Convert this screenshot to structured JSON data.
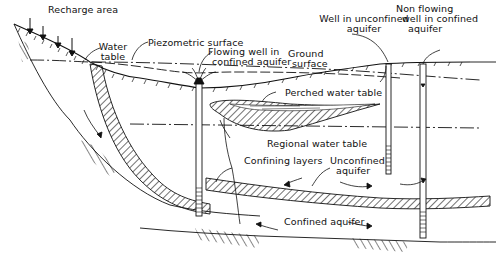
{
  "diagram": {
    "labels": {
      "recharge_area": "Recharge area",
      "water_table_1": "Water",
      "water_table_2": "table",
      "piezometric_surface": "Piezometric surface",
      "flowing_well_1": "Flowing well in",
      "flowing_well_2": "confined aquifer",
      "ground_surface_1": "Ground",
      "ground_surface_2": "surface",
      "well_unconfined_1": "Well in unconfined",
      "well_unconfined_2": "aquifer",
      "nonflowing_1": "Non flowing",
      "nonflowing_2": "well in confined",
      "nonflowing_3": "aquifer",
      "perched_water_table": "Perched water table",
      "regional_water_table": "Regional water table",
      "confining_layers": "Confining layers",
      "unconfined_aquifer_1": "Unconfined",
      "unconfined_aquifer_2": "aquifer",
      "confined_aquifer": "Confined aquifer"
    },
    "colors": {
      "ink": "#111111",
      "background": "#ffffff"
    }
  }
}
